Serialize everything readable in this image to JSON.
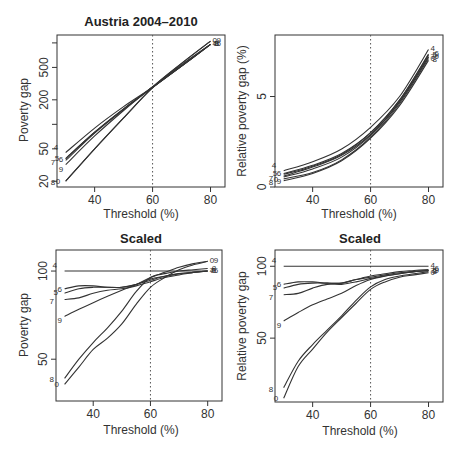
{
  "figure": {
    "panels": [
      {
        "id": "p1",
        "title": "Austria 2004–2010",
        "xlabel": "Threshold (%)",
        "ylabel": "Poverty gap"
      },
      {
        "id": "p2",
        "title": "",
        "xlabel": "Threshold (%)",
        "ylabel": "Relative poverty gap (%)"
      },
      {
        "id": "p3",
        "title": "Scaled",
        "xlabel": "Threshold (%)",
        "ylabel": "Poverty gap"
      },
      {
        "id": "p4",
        "title": "Scaled",
        "xlabel": "Threshold (%)",
        "ylabel": "Relative poverty gap"
      }
    ]
  },
  "chart_data": [
    {
      "type": "line",
      "title": "Austria 2004–2010",
      "xlabel": "Threshold (%)",
      "ylabel": "Poverty gap",
      "yscale": "log",
      "xlim": [
        27,
        85
      ],
      "ylim": [
        17,
        1250
      ],
      "xticks": [
        40,
        60,
        80
      ],
      "yticks": [
        20,
        50,
        100,
        200,
        500,
        1000
      ],
      "ytick_labels": [
        "20",
        "50",
        "",
        "200",
        "500",
        ""
      ],
      "vline": 60,
      "grid": false,
      "legend": "inline series labels at line ends",
      "x": [
        30,
        40,
        50,
        60,
        70,
        80
      ],
      "series": [
        {
          "name": "4",
          "values": [
            45,
            90,
            165,
            285,
            520,
            960
          ]
        },
        {
          "name": "5",
          "values": [
            38,
            80,
            155,
            285,
            520,
            960
          ]
        },
        {
          "name": "6",
          "values": [
            38,
            80,
            155,
            285,
            520,
            960
          ]
        },
        {
          "name": "7",
          "values": [
            36,
            78,
            152,
            285,
            520,
            960
          ]
        },
        {
          "name": "8",
          "values": [
            20,
            50,
            120,
            280,
            540,
            960
          ]
        },
        {
          "name": "9",
          "values": [
            32,
            72,
            148,
            290,
            560,
            1050
          ]
        },
        {
          "name": "0",
          "values": [
            20,
            50,
            120,
            285,
            560,
            1050
          ]
        }
      ]
    },
    {
      "type": "line",
      "title": "",
      "xlabel": "Threshold (%)",
      "ylabel": "Relative poverty gap (%)",
      "yscale": "linear",
      "xlim": [
        27,
        85
      ],
      "ylim": [
        0,
        8.4
      ],
      "xticks": [
        40,
        60,
        80
      ],
      "yticks": [
        0,
        5
      ],
      "vline": 60,
      "grid": false,
      "legend": "inline series labels at line ends",
      "x": [
        30,
        40,
        50,
        60,
        70,
        80
      ],
      "series": [
        {
          "name": "4",
          "values": [
            0.9,
            1.4,
            2.1,
            3.3,
            5.0,
            7.6
          ]
        },
        {
          "name": "5",
          "values": [
            0.7,
            1.15,
            1.8,
            3.0,
            4.8,
            7.3
          ]
        },
        {
          "name": "6",
          "values": [
            0.75,
            1.2,
            1.85,
            3.0,
            4.8,
            7.35
          ]
        },
        {
          "name": "7",
          "values": [
            0.6,
            1.1,
            1.75,
            2.9,
            4.7,
            7.2
          ]
        },
        {
          "name": "8",
          "values": [
            0.35,
            0.75,
            1.45,
            2.7,
            4.5,
            7.0
          ]
        },
        {
          "name": "9",
          "values": [
            0.55,
            1.0,
            1.65,
            2.85,
            4.7,
            7.2
          ]
        },
        {
          "name": "0",
          "values": [
            0.45,
            0.8,
            1.5,
            2.75,
            4.6,
            7.1
          ]
        }
      ]
    },
    {
      "type": "line",
      "title": "Scaled",
      "xlabel": "Threshold (%)",
      "ylabel": "Poverty gap",
      "yscale": "log",
      "xlim": [
        27,
        85
      ],
      "ylim": [
        36,
        118
      ],
      "xticks": [
        40,
        60,
        80
      ],
      "yticks": [
        50,
        100
      ],
      "vline": 60,
      "grid": false,
      "legend": "inline series labels at line ends",
      "x": [
        30,
        35,
        40,
        45,
        50,
        55,
        60,
        65,
        70,
        75,
        80
      ],
      "series": [
        {
          "name": "4",
          "values": [
            100,
            100,
            100,
            100,
            100,
            100,
            100,
            100,
            100,
            100,
            100
          ]
        },
        {
          "name": "5",
          "values": [
            84,
            87,
            88,
            88,
            88,
            90,
            93,
            96,
            98,
            99,
            100
          ]
        },
        {
          "name": "6",
          "values": [
            87,
            89,
            89,
            88,
            88,
            90,
            94,
            96,
            98,
            99,
            100
          ]
        },
        {
          "name": "7",
          "values": [
            80,
            81,
            84,
            86,
            87,
            89,
            92,
            95,
            97,
            99,
            100
          ]
        },
        {
          "name": "8",
          "values": [
            43,
            50,
            57,
            64,
            73,
            85,
            95,
            98,
            100,
            101,
            102
          ]
        },
        {
          "name": "9",
          "values": [
            70,
            74,
            78,
            82,
            86,
            90,
            95,
            99,
            103,
            106,
            108
          ]
        },
        {
          "name": "0",
          "values": [
            41,
            47,
            54,
            59,
            66,
            77,
            88,
            95,
            101,
            105,
            108
          ]
        }
      ]
    },
    {
      "type": "line",
      "title": "Scaled",
      "xlabel": "Threshold (%)",
      "ylabel": "Relative poverty gap",
      "yscale": "log",
      "xlim": [
        27,
        85
      ],
      "ylim": [
        27,
        117
      ],
      "xticks": [
        40,
        60,
        80
      ],
      "yticks": [
        50,
        100
      ],
      "vline": 60,
      "grid": false,
      "legend": "inline series labels at line ends",
      "x": [
        30,
        35,
        40,
        45,
        50,
        55,
        60,
        65,
        70,
        75,
        80
      ],
      "series": [
        {
          "name": "4",
          "values": [
            100,
            100,
            100,
            100,
            100,
            100,
            100,
            100,
            100,
            100,
            100
          ]
        },
        {
          "name": "5",
          "values": [
            81,
            84,
            85,
            85,
            85,
            88,
            90,
            92,
            94,
            95,
            96
          ]
        },
        {
          "name": "6",
          "values": [
            84,
            86,
            86,
            85,
            85,
            88,
            91,
            93,
            95,
            96,
            97
          ]
        },
        {
          "name": "7",
          "values": [
            76,
            77,
            81,
            84,
            84,
            86,
            89,
            91,
            93,
            95,
            96
          ]
        },
        {
          "name": "8",
          "values": [
            31,
            40,
            47,
            54,
            62,
            72,
            82,
            88,
            91,
            93,
            95
          ]
        },
        {
          "name": "9",
          "values": [
            59,
            64,
            69,
            73,
            77,
            83,
            88,
            91,
            93,
            95,
            96
          ]
        },
        {
          "name": "0",
          "values": [
            28,
            38,
            45,
            53,
            61,
            70,
            80,
            86,
            90,
            92,
            94
          ]
        }
      ]
    }
  ]
}
